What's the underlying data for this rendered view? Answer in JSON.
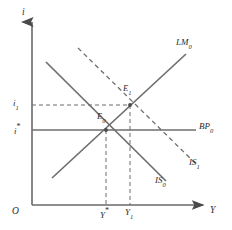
{
  "figure": {
    "type": "is-lm-bp-diagram",
    "background": "#ffffff",
    "ink_color": "#555555",
    "text_color": "#2b2b2b",
    "width": 232,
    "height": 230
  },
  "axes": {
    "vertical_label": "i",
    "horizontal_label": "Y",
    "origin_label": "O",
    "x_axis": {
      "x1": 32,
      "y1": 205,
      "x2": 205,
      "y2": 205
    },
    "y_axis": {
      "x1": 32,
      "y1": 20,
      "x2": 32,
      "y2": 205
    }
  },
  "ticks": {
    "y_axis": [
      {
        "label": "i",
        "sub": "1",
        "star": "",
        "value_y": 105
      },
      {
        "label": "i",
        "sub": "",
        "star": "*",
        "value_y": 130
      }
    ],
    "x_axis": [
      {
        "label": "Y",
        "sub": "",
        "star": "*",
        "value_x": 106
      },
      {
        "label": "Y",
        "sub": "1",
        "star": "",
        "value_x": 130
      }
    ]
  },
  "curves": [
    {
      "name": "LM0",
      "label": "LM",
      "sub": "0",
      "style": "solid",
      "x1": 52,
      "y1": 178,
      "x2": 186,
      "y2": 54,
      "label_x": 176,
      "label_y": 42
    },
    {
      "name": "BP0",
      "label": "BP",
      "sub": "0",
      "style": "solid",
      "x1": 32,
      "y1": 130,
      "x2": 196,
      "y2": 130,
      "label_x": 199,
      "label_y": 124
    },
    {
      "name": "IS0",
      "label": "IS",
      "sub": "0",
      "style": "solid",
      "x1": 46,
      "y1": 62,
      "x2": 166,
      "y2": 181,
      "label_x": 156,
      "label_y": 178
    },
    {
      "name": "IS1",
      "label": "IS",
      "sub": "1",
      "style": "dashed",
      "x1": 78,
      "y1": 48,
      "x2": 196,
      "y2": 164,
      "label_x": 190,
      "label_y": 160
    }
  ],
  "points": [
    {
      "name": "E0",
      "label": "E",
      "sub": "0",
      "x": 106,
      "y": 130,
      "label_x": 97,
      "label_y": 114
    },
    {
      "name": "E1",
      "label": "E",
      "sub": "1",
      "x": 130,
      "y": 105,
      "label_x": 123,
      "label_y": 86
    }
  ],
  "guides": [
    {
      "name": "guide-i1-horizontal",
      "x1": 32,
      "y1": 105,
      "x2": 130,
      "y2": 105,
      "style": "dashed"
    },
    {
      "name": "guide-Ystar-vertical",
      "x1": 106,
      "y1": 130,
      "x2": 106,
      "y2": 205,
      "style": "dashed"
    },
    {
      "name": "guide-Y1-vertical",
      "x1": 130,
      "y1": 105,
      "x2": 130,
      "y2": 205,
      "style": "dashed"
    }
  ]
}
